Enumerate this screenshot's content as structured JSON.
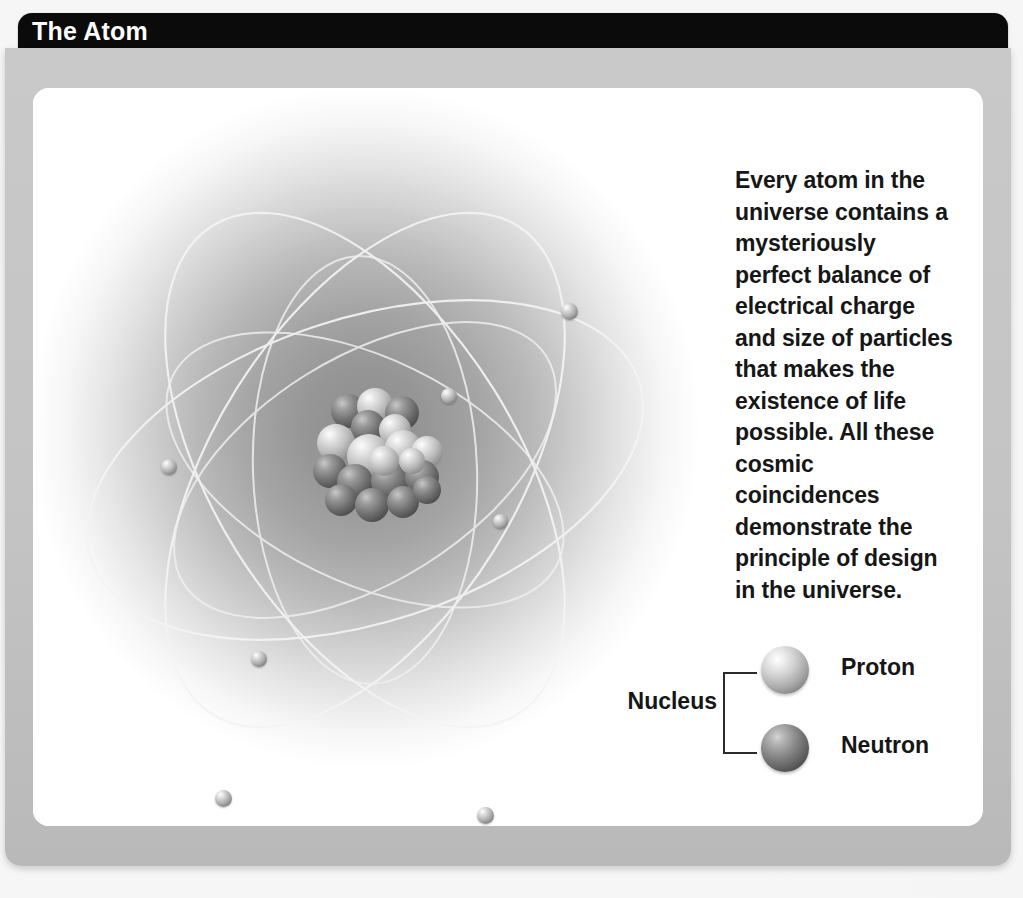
{
  "banner": {
    "title": "The Atom"
  },
  "body": {
    "paragraph": "Every atom in the universe contains a mysteriously perfect balance of electrical charge and size of particles that makes the existence of life possible. All these cosmic coincidences demonstrate the principle of design in the universe."
  },
  "legend": {
    "nucleus_label": "Nucleus",
    "items": [
      {
        "label": "Proton",
        "icon": "proton-sphere"
      },
      {
        "label": "Neutron",
        "icon": "neutron-sphere"
      },
      {
        "label": "Electron",
        "icon": "electron-dot"
      }
    ]
  },
  "ghost_text": {
    "line1": "Finding Confidence",
    "line2": "in a Designed Universe",
    "line3": "the universe had a beginning, and a beginning implies"
  },
  "colors": {
    "banner_background": "#0b0b0b",
    "banner_text": "#ffffff",
    "frame": "#c4c4c4",
    "panel": "#ffffff",
    "text": "#161616",
    "proton": "#c6c6c6",
    "neutron": "#5e5e5e",
    "electron": "#9d9d9d",
    "orbit_line": "#f2f2f2"
  },
  "diagram": {
    "type": "atom-model",
    "nucleus_particles": 19,
    "electron_count": 7,
    "orbit_count": 6
  }
}
